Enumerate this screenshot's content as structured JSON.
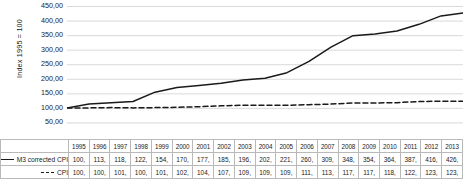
{
  "chart_data": {
    "type": "line",
    "title": "",
    "xlabel": "",
    "ylabel": "Index 1995 = 100",
    "ylim": [
      0,
      450
    ],
    "yticks": [
      50,
      100,
      150,
      200,
      250,
      300,
      350,
      400,
      450
    ],
    "ytick_labels": [
      "50,00",
      "100,00",
      "150,00",
      "200,00",
      "250,00",
      "300,00",
      "350,00",
      "400,00",
      "450,00"
    ],
    "grid": true,
    "legend_position": "table-left",
    "categories": [
      "1995",
      "1996",
      "1997",
      "1998",
      "1999",
      "2000",
      "2001",
      "2002",
      "2003",
      "2004",
      "2005",
      "2006",
      "2007",
      "2008",
      "2009",
      "2010",
      "2011",
      "2012",
      "2013"
    ],
    "series": [
      {
        "name": "M3 corrected CPI",
        "style": "solid",
        "color": "#1a1a1a",
        "values": [
          100,
          113,
          118,
          122,
          154,
          170,
          177,
          185,
          196,
          202,
          221,
          260,
          309,
          348,
          354,
          364,
          387,
          416,
          426
        ],
        "labels": [
          "100,",
          "113,",
          "118,",
          "122,",
          "154,",
          "170,",
          "177,",
          "185,",
          "196,",
          "202,",
          "221,",
          "260,",
          "309,",
          "348,",
          "354,",
          "364,",
          "387,",
          "416,",
          "426,"
        ]
      },
      {
        "name": "CPI",
        "style": "dashed",
        "color": "#1a1a1a",
        "values": [
          100,
          100,
          101,
          100,
          101,
          102,
          104,
          107,
          109,
          109,
          109,
          111,
          113,
          117,
          117,
          118,
          122,
          123,
          123
        ],
        "labels": [
          "100,",
          "100,",
          "101,",
          "100,",
          "101,",
          "102,",
          "104,",
          "107,",
          "109,",
          "109,",
          "109,",
          "111,",
          "113,",
          "117,",
          "117,",
          "118,",
          "122,",
          "123,",
          "123,"
        ]
      }
    ]
  },
  "colors": {
    "line": "#1a1a1a",
    "grid": "#c8c8c8",
    "table_border": "#b9b9b9",
    "text": "#1a1a1a",
    "background": "#ffffff"
  }
}
